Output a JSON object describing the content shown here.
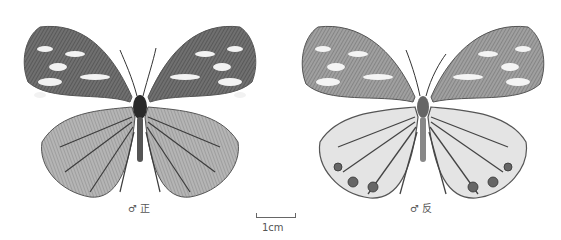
{
  "figure": {
    "specimens": [
      {
        "view": "dorsal",
        "caption": "♂ 正"
      },
      {
        "view": "ventral",
        "caption": "♂ 反"
      }
    ],
    "scale_bar": {
      "label": "1cm"
    },
    "colors": {
      "background": "#ffffff",
      "wing_dark": "#5a5a5a",
      "wing_light": "#e8e8e8",
      "vein": "#3c3c3c"
    }
  }
}
